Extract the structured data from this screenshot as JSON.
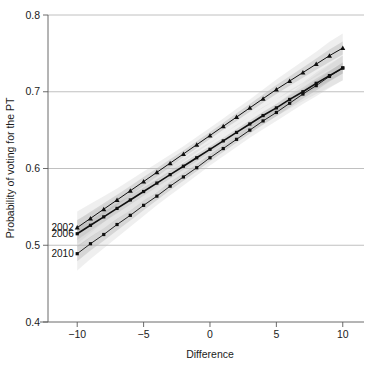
{
  "chart_data": {
    "type": "line",
    "title": "",
    "subtitle": "",
    "xlabel": "Difference",
    "ylabel": "Probability of voting for the PT",
    "xlim": [
      -12.2,
      11.6
    ],
    "ylim": [
      0.4,
      0.8
    ],
    "xticks": [
      -10,
      -5,
      0,
      5,
      10
    ],
    "xticklabels": [
      "−10",
      "−5",
      "0",
      "5",
      "10"
    ],
    "yticks": [
      0.4,
      0.5,
      0.6,
      0.7,
      0.8
    ],
    "yticklabels": [
      "0.4",
      "0.5",
      "0.6",
      "0.7",
      "0.8"
    ],
    "grid": "horizontal",
    "legend_position": "in-plot-left",
    "x": [
      -10,
      -9,
      -8,
      -7,
      -6,
      -5,
      -4,
      -3,
      -2,
      -1,
      0,
      1,
      2,
      3,
      4,
      5,
      6,
      7,
      8,
      9,
      10
    ],
    "series": [
      {
        "name": "2002",
        "marker": "triangle",
        "color": "#101010",
        "line_width": 1.0,
        "label_x": -10,
        "label_y": 0.523,
        "values": [
          0.523,
          0.535,
          0.547,
          0.559,
          0.571,
          0.583,
          0.595,
          0.607,
          0.619,
          0.631,
          0.643,
          0.655,
          0.667,
          0.679,
          0.691,
          0.703,
          0.714,
          0.725,
          0.736,
          0.747,
          0.757
        ],
        "band_low": [
          0.502,
          0.516,
          0.53,
          0.544,
          0.557,
          0.57,
          0.583,
          0.596,
          0.609,
          0.621,
          0.633,
          0.645,
          0.656,
          0.668,
          0.679,
          0.69,
          0.7,
          0.71,
          0.72,
          0.729,
          0.738
        ],
        "band_high": [
          0.544,
          0.554,
          0.564,
          0.574,
          0.585,
          0.596,
          0.607,
          0.618,
          0.629,
          0.641,
          0.653,
          0.665,
          0.678,
          0.69,
          0.703,
          0.716,
          0.728,
          0.74,
          0.752,
          0.765,
          0.776
        ]
      },
      {
        "name": "2006",
        "marker": "square",
        "color": "#101010",
        "line_width": 1.6,
        "label_x": -10,
        "label_y": 0.515,
        "values": [
          0.515,
          0.526,
          0.537,
          0.548,
          0.559,
          0.57,
          0.581,
          0.592,
          0.603,
          0.614,
          0.625,
          0.636,
          0.647,
          0.658,
          0.669,
          0.679,
          0.69,
          0.7,
          0.711,
          0.721,
          0.731
        ],
        "band_low": [
          0.497,
          0.51,
          0.522,
          0.534,
          0.546,
          0.558,
          0.57,
          0.581,
          0.593,
          0.604,
          0.616,
          0.627,
          0.637,
          0.648,
          0.658,
          0.668,
          0.678,
          0.688,
          0.697,
          0.706,
          0.715
        ],
        "band_high": [
          0.533,
          0.542,
          0.552,
          0.562,
          0.572,
          0.582,
          0.592,
          0.603,
          0.613,
          0.624,
          0.634,
          0.645,
          0.657,
          0.668,
          0.68,
          0.69,
          0.702,
          0.712,
          0.725,
          0.736,
          0.747
        ]
      },
      {
        "name": "2010",
        "marker": "square",
        "color": "#101010",
        "line_width": 0.9,
        "label_x": -10,
        "label_y": 0.489,
        "values": [
          0.489,
          0.502,
          0.514,
          0.527,
          0.539,
          0.552,
          0.564,
          0.577,
          0.589,
          0.601,
          0.614,
          0.626,
          0.638,
          0.65,
          0.662,
          0.673,
          0.685,
          0.697,
          0.708,
          0.72,
          0.731
        ],
        "band_low": [
          0.467,
          0.482,
          0.496,
          0.51,
          0.524,
          0.538,
          0.552,
          0.565,
          0.578,
          0.591,
          0.604,
          0.616,
          0.628,
          0.64,
          0.651,
          0.662,
          0.673,
          0.684,
          0.694,
          0.705,
          0.715
        ],
        "band_high": [
          0.511,
          0.522,
          0.532,
          0.544,
          0.554,
          0.566,
          0.576,
          0.589,
          0.6,
          0.611,
          0.624,
          0.636,
          0.648,
          0.66,
          0.673,
          0.684,
          0.697,
          0.71,
          0.722,
          0.735,
          0.747
        ]
      }
    ],
    "annotations": [
      "2002",
      "2006",
      "2010"
    ],
    "band_color_outer": "#c9c9c9",
    "band_color_inner": "#a8a8a8",
    "background": "#ffffff"
  }
}
